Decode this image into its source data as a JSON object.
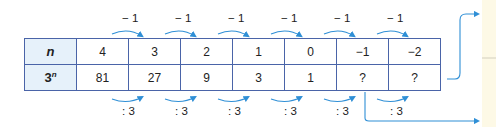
{
  "table": {
    "row_n": {
      "header": "n",
      "values": [
        "4",
        "3",
        "2",
        "1",
        "0",
        "−1",
        "−2"
      ]
    },
    "row_power": {
      "header_base": "3",
      "header_exp": "n",
      "values": [
        "81",
        "27",
        "9",
        "3",
        "1",
        "?",
        "?"
      ]
    }
  },
  "operations": {
    "top": [
      "− 1",
      "− 1",
      "− 1",
      "− 1",
      "− 1",
      "− 1"
    ],
    "bottom": [
      ": 3",
      ": 3",
      ": 3",
      ": 3",
      ": 3"
    ]
  },
  "colors": {
    "border": "#4a64a8",
    "header_fill": "#e6f1fa",
    "arrow": "#2f8fd6",
    "side_panel": "#fdf9e6"
  }
}
